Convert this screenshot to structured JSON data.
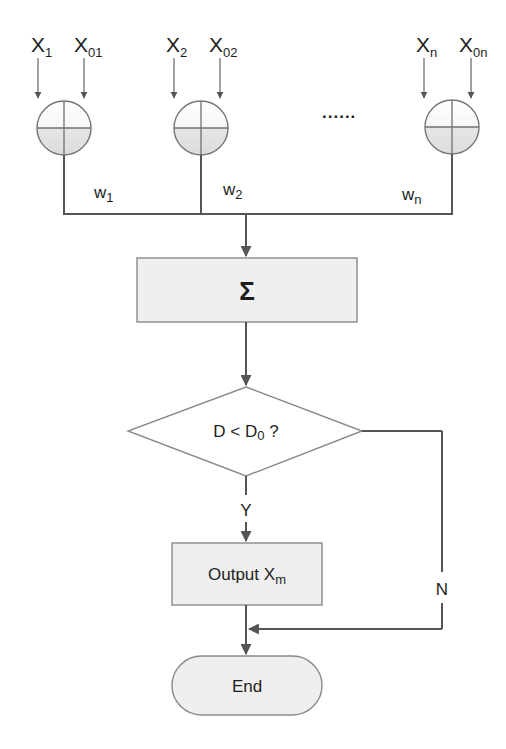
{
  "diagram": {
    "type": "flowchart",
    "inputs": [
      {
        "x_label": "X",
        "x_sub": "1",
        "x0_label": "X",
        "x0_sub": "01",
        "weight": "w",
        "weight_sub": "1"
      },
      {
        "x_label": "X",
        "x_sub": "2",
        "x0_label": "X",
        "x0_sub": "02",
        "weight": "w",
        "weight_sub": "2"
      },
      {
        "x_label": "X",
        "x_sub": "n",
        "x0_label": "X",
        "x0_sub": "0n",
        "weight": "w",
        "weight_sub": "n"
      }
    ],
    "ellipsis": "......",
    "sum_node": {
      "label": "Σ"
    },
    "decision": {
      "label_main": "D < D",
      "label_sub": "0",
      "label_tail": " ?"
    },
    "yes_label": "Y",
    "no_label": "N",
    "output_node": {
      "label_main": "Output  X",
      "label_sub": "m"
    },
    "end_node": {
      "label": "End"
    },
    "colors": {
      "line": "#555555",
      "box_fill": "#efefef",
      "box_stroke": "#8a8a8a",
      "text": "#1e1e1e"
    }
  }
}
